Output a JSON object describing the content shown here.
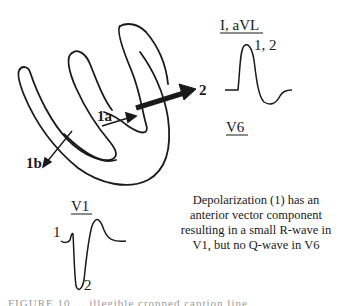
{
  "diagram": {
    "type": "cardiac depolarization vectors and ECG waveforms",
    "vectors": [
      {
        "id": "1a",
        "label": "1a",
        "description": "small septal vector pointing right/anterior"
      },
      {
        "id": "1b",
        "label": "1b",
        "description": "small vector pointing down-left"
      },
      {
        "id": "2",
        "label": "2",
        "description": "large main ventricular vector pointing left"
      }
    ],
    "leads": {
      "lateral": {
        "title": "I, aVL",
        "wave_label": "1, 2",
        "secondary_title": "V6"
      },
      "v1": {
        "title": "V1",
        "label_r": "1",
        "label_s": "2"
      }
    },
    "caption": "Depolarization (1) has an anterior vector component resulting in a small R-wave in V1, but no Q-wave in V6",
    "cutoff_text": "FIGURE 10 ... illegible cropped caption line"
  },
  "colors": {
    "ink": "#1a1a1a",
    "background": "#ffffff"
  }
}
